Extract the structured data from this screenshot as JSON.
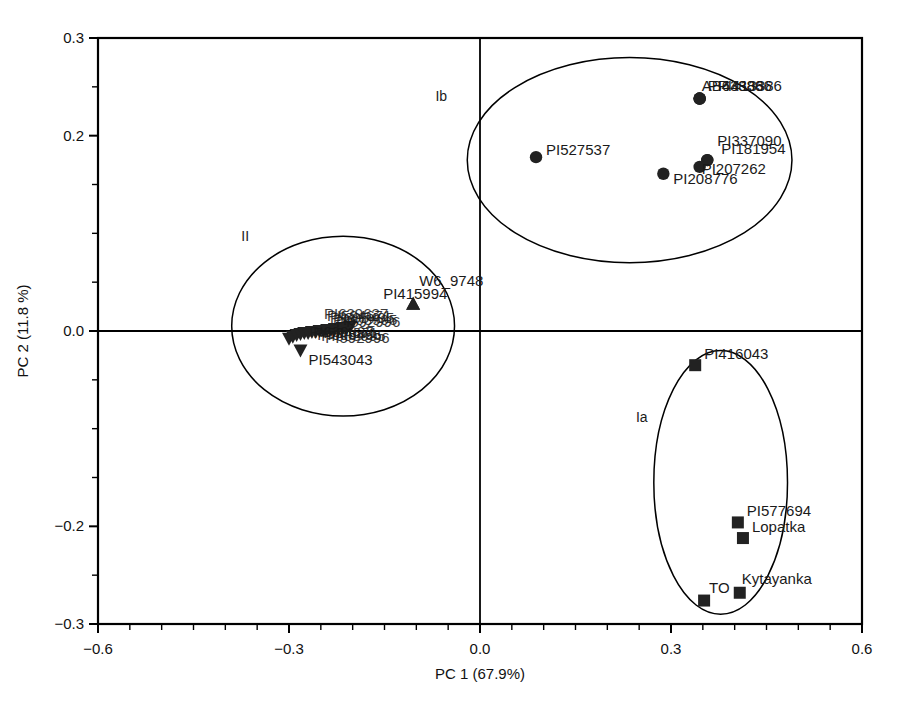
{
  "chart_data": {
    "type": "scatter",
    "title": "",
    "xlabel": "PC 1 (67.9%)",
    "ylabel": "PC 2 (11.8 %)",
    "xlim": [
      -0.6,
      0.6
    ],
    "ylim": [
      -0.3,
      0.3
    ],
    "xticks": [
      -0.6,
      -0.3,
      0.0,
      0.3,
      0.6
    ],
    "xticklabels": [
      "-0.6",
      "-0.3",
      "0.0",
      "0.3",
      "0.6"
    ],
    "yticks": [
      -0.3,
      -0.2,
      0.0,
      0.2,
      0.3
    ],
    "yticklabels": [
      "-0.3",
      "-0.2",
      "0.0",
      "0.2",
      "0.3"
    ],
    "minor_tick_step": 0.05,
    "grid": false,
    "legend": "none",
    "origin_lines": true,
    "marker_color": "#222222",
    "line_color": "#000000",
    "groups": [
      {
        "name": "Ib",
        "label": "Ib",
        "marker": "circle",
        "label_x": -0.07,
        "label_y": 0.235,
        "ellipse": {
          "cx": 0.235,
          "cy": 0.175,
          "rx": 0.255,
          "ry": 0.105,
          "rotation": 0
        },
        "points": [
          {
            "label": "PI643886",
            "x": 0.345,
            "y": 0.238,
            "label_dx": 8,
            "label_dy": -8
          },
          {
            "label": "PI413386",
            "x": 0.345,
            "y": 0.238,
            "label_dx": 18,
            "label_dy": -8
          },
          {
            "label": "AB43886",
            "x": 0.345,
            "y": 0.238,
            "label_dx": 2,
            "label_dy": -8
          },
          {
            "label": "PI527537",
            "x": 0.088,
            "y": 0.178,
            "label_dx": 10,
            "label_dy": -2
          },
          {
            "label": "PI337090",
            "x": 0.357,
            "y": 0.175,
            "label_dx": 10,
            "label_dy": -14
          },
          {
            "label": "PI181954",
            "x": 0.357,
            "y": 0.175,
            "label_dx": 14,
            "label_dy": 0
          },
          {
            "label": "PI207262",
            "x": 0.345,
            "y": 0.168,
            "label_dx": 2,
            "label_dy": 7
          },
          {
            "label": "PI208776",
            "x": 0.288,
            "y": 0.161,
            "label_dx": 10,
            "label_dy": 10
          }
        ]
      },
      {
        "name": "Ia",
        "label": "Ia",
        "marker": "square",
        "label_x": 0.245,
        "label_y": -0.093,
        "ellipse": {
          "cx": 0.378,
          "cy": -0.155,
          "rx": 0.105,
          "ry": 0.135,
          "rotation": 0
        },
        "points": [
          {
            "label": "PI416043",
            "x": 0.338,
            "y": -0.035,
            "label_dx": 9,
            "label_dy": -6
          },
          {
            "label": "PI577694",
            "x": 0.405,
            "y": -0.196,
            "label_dx": 9,
            "label_dy": -6
          },
          {
            "label": "Lopatka",
            "x": 0.413,
            "y": -0.212,
            "label_dx": 9,
            "label_dy": -6
          },
          {
            "label": "Kytayanka",
            "x": 0.408,
            "y": -0.268,
            "label_dx": 2,
            "label_dy": -9
          },
          {
            "label": "TO",
            "x": 0.352,
            "y": -0.276,
            "label_dx": 5,
            "label_dy": -8
          }
        ]
      },
      {
        "name": "II",
        "label": "II",
        "marker": "triangle-down",
        "label_x": -0.375,
        "label_y": 0.092,
        "ellipse": {
          "cx": -0.215,
          "cy": 0.005,
          "rx": 0.175,
          "ry": 0.092,
          "rotation": 0
        },
        "points": [
          {
            "label": "W6_9748",
            "x": -0.105,
            "y": 0.028,
            "label_dx": 6,
            "label_dy": -18,
            "marker": "triangle-up"
          },
          {
            "label": "PI415994",
            "x": -0.105,
            "y": 0.028,
            "label_dx": -30,
            "label_dy": -5,
            "marker": "triangle-up"
          },
          {
            "label": "PI543043",
            "x": -0.282,
            "y": -0.02,
            "label_dx": 8,
            "label_dy": 14
          },
          {
            "label": "",
            "x": -0.3,
            "y": -0.008
          },
          {
            "label": "",
            "x": -0.294,
            "y": -0.006
          },
          {
            "label": "",
            "x": -0.288,
            "y": -0.004
          },
          {
            "label": "",
            "x": -0.282,
            "y": -0.003
          },
          {
            "label": "",
            "x": -0.276,
            "y": -0.002
          },
          {
            "label": "",
            "x": -0.27,
            "y": -0.002
          },
          {
            "label": "",
            "x": -0.264,
            "y": -0.001
          },
          {
            "label": "",
            "x": -0.258,
            "y": -0.001
          },
          {
            "label": "",
            "x": -0.252,
            "y": 0.0
          },
          {
            "label": "",
            "x": -0.246,
            "y": 0.0
          },
          {
            "label": "",
            "x": -0.24,
            "y": 0.001
          },
          {
            "label": "",
            "x": -0.234,
            "y": 0.001
          },
          {
            "label": "",
            "x": -0.228,
            "y": 0.002
          },
          {
            "label": "",
            "x": -0.222,
            "y": 0.002
          },
          {
            "label": "",
            "x": -0.216,
            "y": 0.003
          },
          {
            "label": "",
            "x": -0.21,
            "y": 0.003
          },
          {
            "label": "",
            "x": -0.204,
            "y": 0.004
          }
        ],
        "cluster_label_blob": [
          "PI639637",
          "PI594671",
          "PI605495",
          "PI603995",
          "PI592996"
        ]
      }
    ]
  }
}
